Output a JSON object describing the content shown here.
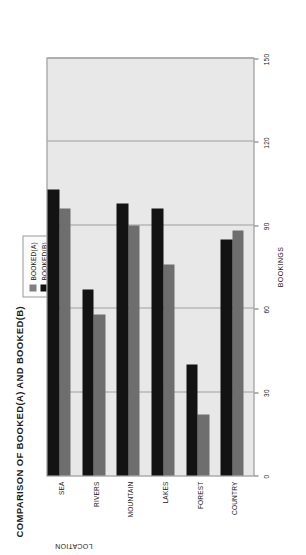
{
  "chart_data": {
    "type": "bar",
    "orientation": "horizontal",
    "title": "COMPARISON OF BOOKED(A) AND BOOKED(B)",
    "xlabel": "BOOKINGS",
    "ylabel": "LOCATION",
    "categories": [
      "COUNTRY",
      "FOREST",
      "LAKES",
      "MOUNTAIN",
      "RIVERS",
      "SEA"
    ],
    "series": [
      {
        "name": "BOOKED(A)",
        "color": "#6e6e6e",
        "values": [
          88,
          22,
          76,
          90,
          58,
          96
        ]
      },
      {
        "name": "BOOKED(B)",
        "color": "#131313",
        "values": [
          85,
          40,
          96,
          98,
          67,
          103
        ]
      }
    ],
    "xlim": [
      0,
      150
    ],
    "xticks": [
      0,
      30,
      60,
      90,
      120,
      150
    ],
    "xtick_labels": [
      "0",
      "30",
      "60",
      "90",
      "120",
      "150"
    ],
    "grid": true,
    "legend_position": "top-right",
    "plot_background": "#e8e8e8"
  },
  "legend": {
    "entries": [
      {
        "label": "BOOKED(A)"
      },
      {
        "label": "BOOKED(B)"
      }
    ]
  }
}
